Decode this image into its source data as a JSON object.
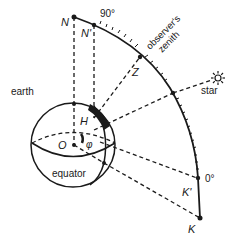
{
  "diagram": {
    "labels": {
      "N": "N",
      "N_prime": "N'",
      "deg90": "90°",
      "observers_zenith_line1": "observer's",
      "observers_zenith_line2": "zenith",
      "Z": "Z",
      "star": "star",
      "earth": "earth",
      "H": "H",
      "O": "O",
      "phi": "φ",
      "equator": "equator",
      "deg0": "0°",
      "K_prime": "K'",
      "K": "K"
    },
    "colors": {
      "ink": "#1a1a1a",
      "background": "#ffffff"
    }
  }
}
